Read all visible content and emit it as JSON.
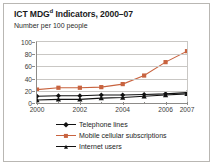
{
  "figure": {
    "title_main": "ICT MDG",
    "title_sup": "d",
    "title_rest": " Indicators, 2000–07",
    "subtitle": "Number per 100 people"
  },
  "colors": {
    "mobile": "#c8633f",
    "telephone": "#111111",
    "internet": "#111111",
    "grid": "#c9c7c4",
    "axis": "#8d8b88",
    "frame": "#b9b7b3",
    "background": "#ffffff"
  },
  "chart_data": {
    "type": "line",
    "title": "ICT MDGd Indicators, 2000–07",
    "subtitle": "Number per 100 people",
    "xlabel": "",
    "ylabel": "Number per 100 people",
    "x": [
      2000,
      2001,
      2002,
      2003,
      2004,
      2005,
      2006,
      2007
    ],
    "xticks": [
      2000,
      2002,
      2004,
      2006,
      2007
    ],
    "xticklabels": [
      "2000",
      "2002",
      "2004",
      "2006",
      "2007"
    ],
    "xlim": [
      2000,
      2007
    ],
    "yticks": [
      0,
      20,
      40,
      60,
      80,
      100
    ],
    "yticklabels": [
      "0",
      "20",
      "40",
      "60",
      "80",
      "100"
    ],
    "ylim": [
      0,
      100
    ],
    "grid": "horizontal",
    "legend_position": "bottom",
    "series": [
      {
        "name": "Telephone lines",
        "marker": "diamond",
        "color": "#111111",
        "values": [
          11,
          12,
          12,
          13,
          13,
          14,
          15,
          17
        ]
      },
      {
        "name": "Mobile cellular subscriptions",
        "marker": "square",
        "color": "#c8633f",
        "values": [
          22,
          25,
          25,
          26,
          31,
          45,
          67,
          85
        ]
      },
      {
        "name": "Internet users",
        "marker": "triangle",
        "color": "#111111",
        "values": [
          5,
          6,
          6,
          8,
          9,
          11,
          13,
          15
        ]
      }
    ]
  },
  "legend": {
    "items": [
      {
        "label": "Telephone lines",
        "marker": "diamond",
        "color": "#111111"
      },
      {
        "label": "Mobile cellular subscriptions",
        "marker": "square",
        "color": "#c8633f"
      },
      {
        "label": "Internet users",
        "marker": "triangle",
        "color": "#111111"
      }
    ]
  }
}
